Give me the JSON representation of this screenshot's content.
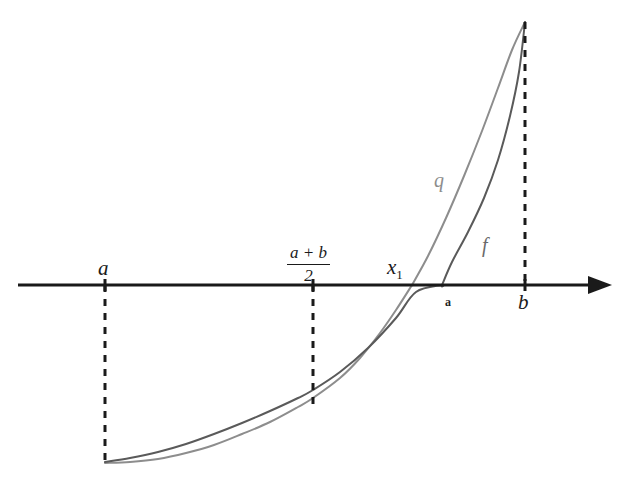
{
  "figure": {
    "background_color": "#ffffff",
    "width": 628,
    "height": 493
  },
  "axis": {
    "name": "x-axis",
    "color": "#1a1a1a",
    "y": 285,
    "x_start": 18,
    "x_end": 612,
    "stroke_width": 3.2,
    "arrow_label": "arrow-right"
  },
  "labels": {
    "point_a": "a",
    "point_b": "b",
    "midpoint_numerator": "a + b",
    "midpoint_denominator": "2",
    "x1_base": "x",
    "x1_subscript": "1",
    "root_a": "a",
    "curve_q": "q",
    "curve_f": "f"
  },
  "markers": [
    {
      "name": "a",
      "x": 105,
      "label_x": 98,
      "label_y": 258
    },
    {
      "name": "midpoint",
      "x": 313,
      "label_x": 287,
      "label_y": 243
    },
    {
      "name": "x1",
      "x": 412,
      "label_x": 387,
      "label_y": 257
    },
    {
      "name": "b",
      "x": 525,
      "label_x": 518,
      "label_y": 292
    }
  ],
  "dashed_lines": [
    {
      "name": "dash-at-a",
      "x": 105,
      "y_top": 285,
      "y_bottom": 462
    },
    {
      "name": "dash-at-midpoint",
      "x": 313,
      "y_top": 285,
      "y_bottom": 405
    },
    {
      "name": "dash-at-b",
      "x": 525,
      "y_top": 22,
      "y_bottom": 285
    }
  ],
  "dash_style": {
    "color": "#1a1a1a",
    "stroke_width": 3,
    "dash_array": "7 7"
  },
  "chart_data": {
    "type": "line",
    "title": "",
    "xlabel": "",
    "ylabel": "",
    "grid": false,
    "legend": "inline-curve-labels",
    "xlim": [
      18,
      612
    ],
    "ylim": [
      493,
      0
    ],
    "annotations": [
      {
        "text": "a",
        "x": 105,
        "y": 285,
        "role": "interval-left-endpoint"
      },
      {
        "text": "(a+b)/2",
        "x": 313,
        "y": 285,
        "role": "interval-midpoint"
      },
      {
        "text": "x_1",
        "x": 412,
        "y": 285,
        "role": "interpolant-root"
      },
      {
        "text": "a",
        "x": 442,
        "y": 285,
        "role": "true-root-of-f"
      },
      {
        "text": "b",
        "x": 525,
        "y": 285,
        "role": "interval-right-endpoint"
      }
    ],
    "series": [
      {
        "name": "f",
        "color": "#5a5a5a",
        "stroke_width": 2.0,
        "label_x": 482,
        "label_y": 235,
        "points": [
          [
            105,
            462
          ],
          [
            130,
            458
          ],
          [
            158,
            452
          ],
          [
            186,
            444
          ],
          [
            214,
            434
          ],
          [
            242,
            423
          ],
          [
            270,
            411
          ],
          [
            298,
            398
          ],
          [
            313,
            390
          ],
          [
            340,
            372
          ],
          [
            368,
            348
          ],
          [
            396,
            318
          ],
          [
            416,
            292
          ],
          [
            442,
            285
          ],
          [
            442,
            285
          ],
          [
            452,
            262
          ],
          [
            468,
            232
          ],
          [
            484,
            198
          ],
          [
            498,
            160
          ],
          [
            510,
            116
          ],
          [
            519,
            72
          ],
          [
            525,
            22
          ]
        ]
      },
      {
        "name": "q",
        "color": "#8d8d8d",
        "stroke_width": 2.0,
        "label_x": 434,
        "label_y": 170,
        "points": [
          [
            105,
            463
          ],
          [
            130,
            462
          ],
          [
            158,
            459
          ],
          [
            186,
            453
          ],
          [
            214,
            445
          ],
          [
            242,
            434
          ],
          [
            270,
            422
          ],
          [
            298,
            407
          ],
          [
            313,
            398
          ],
          [
            340,
            378
          ],
          [
            360,
            358
          ],
          [
            380,
            333
          ],
          [
            396,
            310
          ],
          [
            412,
            285
          ],
          [
            412,
            285
          ],
          [
            428,
            256
          ],
          [
            446,
            218
          ],
          [
            464,
            176
          ],
          [
            482,
            131
          ],
          [
            498,
            88
          ],
          [
            512,
            50
          ],
          [
            525,
            22
          ]
        ]
      }
    ]
  }
}
